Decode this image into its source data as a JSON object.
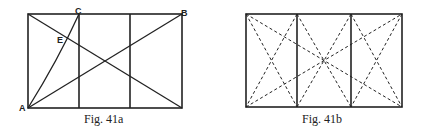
{
  "figures": [
    {
      "id": "fig-41a",
      "caption": "Fig. 41a",
      "points": {
        "A": "A",
        "B": "B",
        "C": "C",
        "E": "E"
      }
    },
    {
      "id": "fig-41b",
      "caption": "Fig. 41b"
    }
  ],
  "colors": {
    "ink": "#222222",
    "background": "#ffffff"
  }
}
